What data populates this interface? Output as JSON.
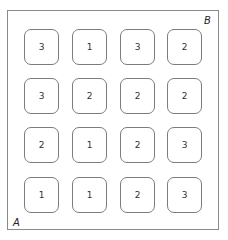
{
  "diagram": {
    "corner_labels": {
      "top_right": "B",
      "bottom_left": "A"
    },
    "grid": {
      "rows": 4,
      "cols": 4,
      "cells": [
        [
          "3",
          "1",
          "3",
          "2"
        ],
        [
          "3",
          "2",
          "2",
          "2"
        ],
        [
          "2",
          "1",
          "2",
          "3"
        ],
        [
          "1",
          "1",
          "2",
          "3"
        ]
      ]
    }
  }
}
